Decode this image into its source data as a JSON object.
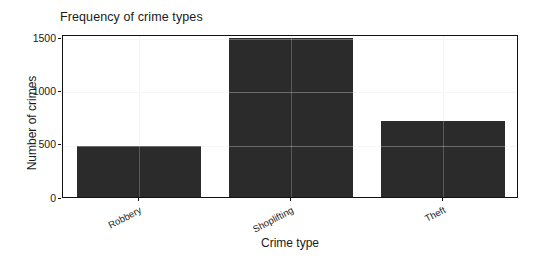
{
  "chart_data": {
    "type": "bar",
    "title": "Frequency of crime types",
    "xlabel": "Crime type",
    "ylabel": "Number of crimes",
    "categories": [
      "Robbery",
      "Shoplifting",
      "Theft"
    ],
    "values": [
      480,
      1490,
      715
    ],
    "ylim": [
      0,
      1500
    ],
    "yticks": [
      0,
      500,
      1000,
      1500
    ],
    "ytick_labels": [
      "0",
      "500",
      "1000",
      "1500"
    ],
    "grid": true,
    "legend": "none",
    "bar_color": "#2b2b2b",
    "plot_background": "#ffffff",
    "figure_background": "#ffffff",
    "axis_color": "#111111",
    "grid_color": "#f2f2f2",
    "xtick_label_rotation": -28
  }
}
